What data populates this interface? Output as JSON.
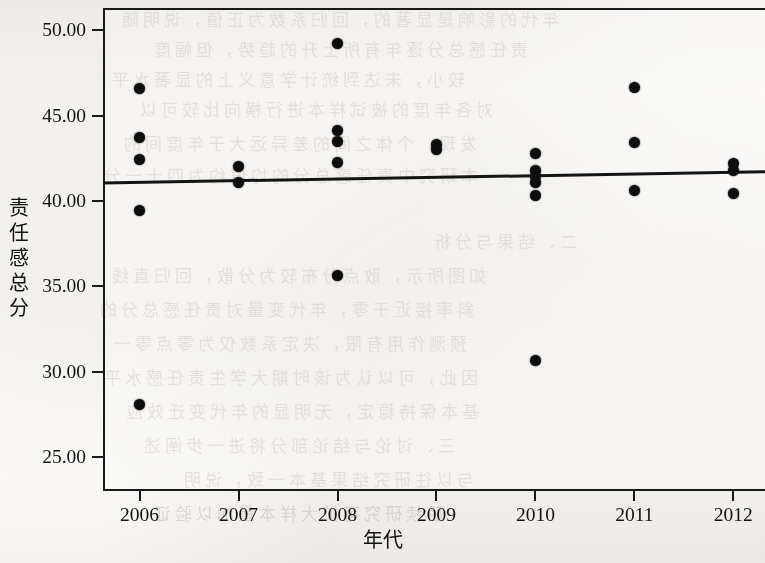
{
  "figure": {
    "kind": "scatter-with-regression-line",
    "background_color": "#fbfaf8",
    "point_color": "#0d0d0d",
    "line_color": "#141414"
  },
  "axes": {
    "y_title_chars": [
      "责",
      "任",
      "感",
      "总",
      "分"
    ],
    "y_title": "责任感总分",
    "x_title": "年代",
    "y_ticks": [
      "50.00",
      "45.00",
      "40.00",
      "35.00",
      "30.00",
      "25.00"
    ],
    "y_tick_values": [
      50,
      45,
      40,
      35,
      30,
      25
    ],
    "x_ticks": [
      "2006",
      "2007",
      "2008",
      "2009",
      "2010",
      "2011",
      "2012"
    ],
    "x_tick_values": [
      2006,
      2007,
      2008,
      2009,
      2010,
      2011,
      2012
    ]
  },
  "bleed_through_lines": [
    {
      "text": "年代的影响是显著的，回归系数为正值，说明随",
      "x": 118,
      "y": 6
    },
    {
      "text": "责任感总分逐年有所上升的趋势，但幅度",
      "x": 150,
      "y": 36
    },
    {
      "text": "较小，未达到统计学意义上的显著水平",
      "x": 108,
      "y": 66
    },
    {
      "text": "对各年度的被试样本进行横向比较可以",
      "x": 136,
      "y": 96
    },
    {
      "text": "发现，个体之间的差异远大于年度间的",
      "x": 120,
      "y": 130
    },
    {
      "text": "本研究中责任感总分的均值约为四十一分",
      "x": 100,
      "y": 162
    },
    {
      "text": "二、结果与分析",
      "x": 430,
      "y": 228
    },
    {
      "text": "如图所示，散点分布较为分散，回归直线",
      "x": 108,
      "y": 262
    },
    {
      "text": "斜率接近于零，年代变量对责任感总分的",
      "x": 96,
      "y": 296
    },
    {
      "text": "预测作用有限，决定系数仅为零点零一",
      "x": 110,
      "y": 330
    },
    {
      "text": "因此，可以认为该时期大学生责任感水平",
      "x": 100,
      "y": 364
    },
    {
      "text": "基本保持稳定，无明显的年代变迁效应",
      "x": 122,
      "y": 398
    },
    {
      "text": "三、讨论与结论部分将进一步阐述",
      "x": 140,
      "y": 432
    },
    {
      "text": "与以往研究结果基本一致，说明",
      "x": 180,
      "y": 466
    },
    {
      "text": "后续研究可扩大样本量加以验证",
      "x": 150,
      "y": 500
    }
  ],
  "chart_data": {
    "type": "scatter",
    "title": "",
    "xlabel": "年代",
    "ylabel": "责任感总分",
    "xlim": [
      2005.63,
      2012.32
    ],
    "ylim": [
      23.0,
      51.3
    ],
    "grid": false,
    "legend": "none",
    "y_tick_step": 5,
    "series": [
      {
        "name": "责任感总分",
        "marker": "filled-circle",
        "points": [
          {
            "x": 2006,
            "y": 46.6
          },
          {
            "x": 2006,
            "y": 43.7
          },
          {
            "x": 2006,
            "y": 42.45
          },
          {
            "x": 2006,
            "y": 39.45
          },
          {
            "x": 2006,
            "y": 28.05
          },
          {
            "x": 2007,
            "y": 42.0
          },
          {
            "x": 2007,
            "y": 41.1
          },
          {
            "x": 2008,
            "y": 49.2
          },
          {
            "x": 2008,
            "y": 44.15
          },
          {
            "x": 2008,
            "y": 43.45
          },
          {
            "x": 2008,
            "y": 42.25
          },
          {
            "x": 2008,
            "y": 35.6
          },
          {
            "x": 2009,
            "y": 43.3
          },
          {
            "x": 2009,
            "y": 43.0
          },
          {
            "x": 2010,
            "y": 42.75
          },
          {
            "x": 2010,
            "y": 41.8
          },
          {
            "x": 2010,
            "y": 41.45
          },
          {
            "x": 2010,
            "y": 41.05
          },
          {
            "x": 2010,
            "y": 40.3
          },
          {
            "x": 2010,
            "y": 30.65
          },
          {
            "x": 2011,
            "y": 46.65
          },
          {
            "x": 2011,
            "y": 43.4
          },
          {
            "x": 2011,
            "y": 40.6
          },
          {
            "x": 2012,
            "y": 42.2
          },
          {
            "x": 2012,
            "y": 41.75
          },
          {
            "x": 2012,
            "y": 40.45
          }
        ]
      }
    ],
    "regression_line": {
      "name": "fit-line",
      "x_start": 2005.63,
      "y_start": 41.05,
      "x_end": 2012.32,
      "y_end": 41.7,
      "slope": 0.097,
      "color": "#141414"
    }
  }
}
